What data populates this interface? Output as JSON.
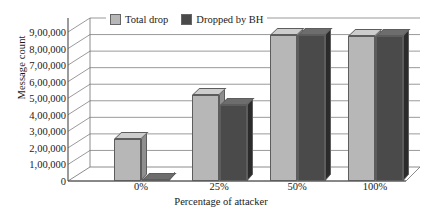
{
  "chart_data": {
    "type": "bar",
    "title": "",
    "xlabel": "Percentage of attacker",
    "ylabel": "Message count",
    "categories": [
      "0%",
      "25%",
      "50%",
      "100%"
    ],
    "series": [
      {
        "name": "Total drop",
        "color": "#b7b7b7",
        "values": [
          255000,
          520000,
          880000,
          875000
        ]
      },
      {
        "name": "Dropped by BH",
        "color": "#4a4a4a",
        "values": [
          5000,
          460000,
          880000,
          875000
        ]
      }
    ],
    "ylim": [
      0,
      900000
    ],
    "ytick_values": [
      0,
      100000,
      200000,
      300000,
      400000,
      500000,
      600000,
      700000,
      800000,
      900000
    ],
    "ytick_labels": [
      "0",
      "1,00,000",
      "2,00,000",
      "3,00,000",
      "4,00,000",
      "5,00,000",
      "6,00,000",
      "7,00,000",
      "8,00,000",
      "9,00,000"
    ],
    "grid": true,
    "legend_position": "top-left",
    "style": "3d-column"
  }
}
